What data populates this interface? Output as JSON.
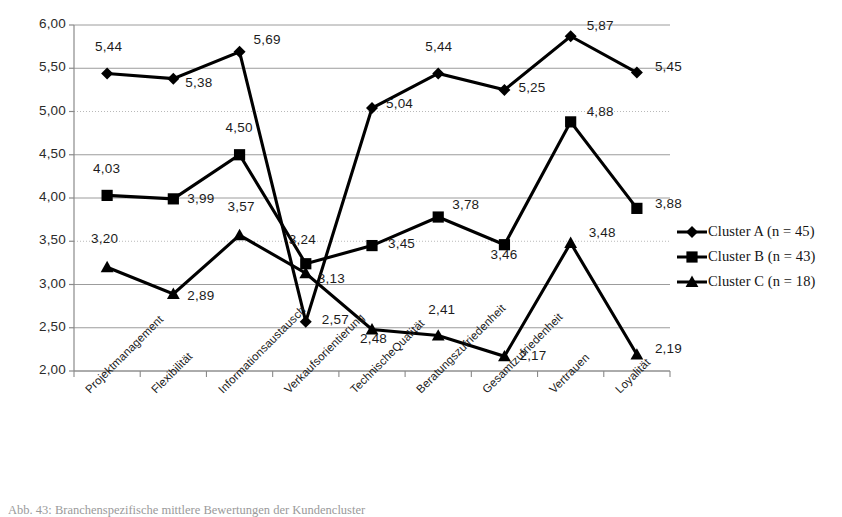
{
  "chart_data": {
    "type": "line",
    "title": "",
    "xlabel": "",
    "ylabel": "",
    "ylim": [
      2.0,
      6.0
    ],
    "ytick_step": 0.5,
    "grid": true,
    "legend_position": "right",
    "decimal_separator": ",",
    "categories": [
      "Projektmanagement",
      "Flexibilität",
      "Informationsaustausch",
      "Verkaufsorientierung",
      "TechnischeQualität",
      "Beratungszufriedenheit",
      "Gesamtzufriedenheit",
      "Vertrauen",
      "Loyalität"
    ],
    "ytick_labels": [
      "2,00",
      "2,50",
      "3,00",
      "3,50",
      "4,00",
      "4,50",
      "5,00",
      "5,50",
      "6,00"
    ],
    "ytick_values": [
      2.0,
      2.5,
      3.0,
      3.5,
      4.0,
      4.5,
      5.0,
      5.5,
      6.0
    ],
    "series": [
      {
        "name": "Cluster A (n = 45)",
        "marker": "diamond",
        "color": "#000000",
        "values": [
          5.44,
          5.38,
          5.69,
          2.57,
          5.04,
          5.44,
          5.25,
          5.87,
          5.45
        ],
        "labels": [
          "5,44",
          "5,38",
          "5,69",
          "2,57",
          "5,04",
          "5,44",
          "5,25",
          "5,87",
          "5,45"
        ]
      },
      {
        "name": "Cluster B (n = 43)",
        "marker": "square",
        "color": "#000000",
        "values": [
          4.03,
          3.99,
          4.5,
          3.24,
          3.45,
          3.78,
          3.46,
          4.88,
          3.88
        ],
        "labels": [
          "4,03",
          "3,99",
          "4,50",
          "3,24",
          "3,45",
          "3,78",
          "3,46",
          "4,88",
          "3,88"
        ]
      },
      {
        "name": "Cluster C (n = 18)",
        "marker": "triangle",
        "color": "#000000",
        "values": [
          3.2,
          2.89,
          3.57,
          3.13,
          2.48,
          2.41,
          2.17,
          3.48,
          2.19
        ],
        "labels": [
          "3,20",
          "2,89",
          "3,57",
          "3,13",
          "2,48",
          "2,41",
          "2,17",
          "3,48",
          "2,19"
        ]
      }
    ]
  },
  "legend": {
    "items": [
      {
        "label": "Cluster A (n = 45)",
        "marker": "diamond-marker-icon"
      },
      {
        "label": "Cluster B (n = 43)",
        "marker": "square-marker-icon"
      },
      {
        "label": "Cluster C (n = 18)",
        "marker": "triangle-marker-icon"
      }
    ]
  },
  "caption": {
    "text": "Abb. 43:  Branchenspezifische mittlere Bewertungen der Kundencluster"
  }
}
